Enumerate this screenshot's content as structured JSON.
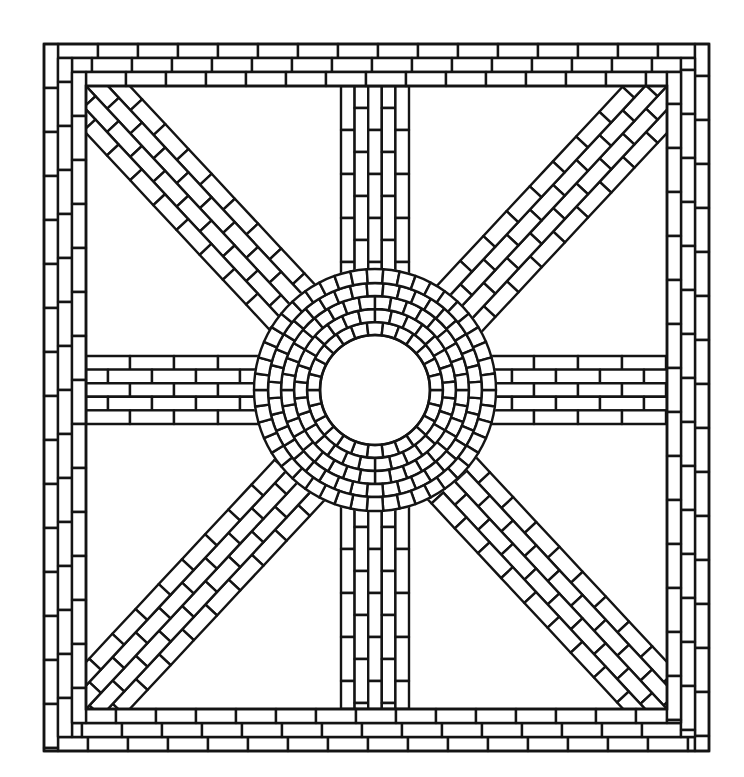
{
  "figure": {
    "colors": {
      "line": "#141414",
      "fill": "#ffffff",
      "background": "#ffffff"
    },
    "canvas": {
      "width": 744,
      "height": 777
    }
  },
  "frame": {
    "outer": {
      "x": 44,
      "y": 44,
      "w": 665,
      "h": 707
    },
    "courses": 3,
    "course_width": 14,
    "brick_length": 40
  },
  "field": {
    "x": 86,
    "y": 86,
    "w": 581,
    "h": 623
  },
  "center": {
    "cx": 375,
    "cy": 390
  },
  "ring": {
    "inner_radius": 55,
    "rings": [
      {
        "r0": 55,
        "r1": 68,
        "count": 26
      },
      {
        "r0": 68,
        "r1": 81,
        "count": 30
      },
      {
        "r0": 81,
        "r1": 94,
        "count": 36
      },
      {
        "r0": 94,
        "r1": 107,
        "count": 40
      },
      {
        "r0": 107,
        "r1": 121,
        "count": 46
      }
    ]
  },
  "bands": {
    "vertical": {
      "x": 341,
      "w": 68,
      "courses": 5,
      "brick_length": 44
    },
    "horizontal": {
      "y": 356,
      "h": 68,
      "courses": 5,
      "brick_length": 44
    },
    "diagonal": {
      "width": 64,
      "courses": 4,
      "brick_length": 34
    }
  }
}
